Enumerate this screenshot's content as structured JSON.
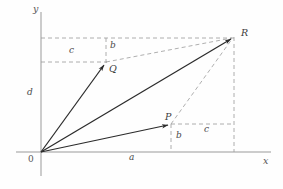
{
  "figure": {
    "kind": "vector-addition-diagram",
    "background_color": "#fefefe",
    "axis_color": "#9a9a9a",
    "vector_color": "#2b2b2b",
    "dashed_color": "#9a9a9a",
    "label_color": "#4a4a4a",
    "width": 283,
    "height": 189
  },
  "axes": {
    "origin": {
      "label": "0",
      "x": 41,
      "y": 152
    },
    "x_axis": {
      "label": "x",
      "from_x": 16,
      "to_x": 271,
      "y": 152,
      "label_x": 263,
      "label_y": 158
    },
    "y_axis": {
      "label": "y",
      "x": 41,
      "from_y": 12,
      "to_y": 176,
      "label_x": 33,
      "label_y": 6
    }
  },
  "points": [
    {
      "name": "O",
      "label": "0",
      "x": 41,
      "y": 152,
      "label_x": 29,
      "label_y": 158
    },
    {
      "name": "Q",
      "label": "Q",
      "x": 106,
      "y": 62,
      "label_x": 109,
      "label_y": 65
    },
    {
      "name": "P",
      "label": "P",
      "x": 171,
      "y": 124,
      "label_x": 165,
      "label_y": 114
    },
    {
      "name": "R",
      "label": "R",
      "x": 234,
      "y": 37,
      "label_x": 241,
      "label_y": 30
    }
  ],
  "vectors": [
    {
      "name": "OQ",
      "from": "O",
      "to": "Q",
      "x1": 41,
      "y1": 152,
      "x2": 106,
      "y2": 62,
      "style": "solid-arrow"
    },
    {
      "name": "OR",
      "from": "O",
      "to": "R",
      "x1": 41,
      "y1": 152,
      "x2": 234,
      "y2": 37,
      "style": "solid-arrow"
    },
    {
      "name": "OP",
      "from": "O",
      "to": "P",
      "x1": 41,
      "y1": 152,
      "x2": 171,
      "y2": 124,
      "style": "solid-arrow"
    }
  ],
  "construction_lines": [
    {
      "name": "QR-dashed",
      "x1": 106,
      "y1": 62,
      "x2": 234,
      "y2": 37
    },
    {
      "name": "PR-dashed",
      "x1": 171,
      "y1": 124,
      "x2": 234,
      "y2": 37
    },
    {
      "name": "top-horizontal-dashed",
      "x1": 41,
      "y1": 38,
      "x2": 234,
      "y2": 38
    },
    {
      "name": "q-horizontal-dashed",
      "x1": 41,
      "y1": 62,
      "x2": 106,
      "y2": 62
    },
    {
      "name": "p-horizontal-dashed",
      "x1": 171,
      "y1": 124,
      "x2": 234,
      "y2": 124
    },
    {
      "name": "q-vertical-dashed",
      "x1": 106,
      "y1": 38,
      "x2": 106,
      "y2": 62
    },
    {
      "name": "p-vertical-dashed",
      "x1": 171,
      "y1": 124,
      "x2": 171,
      "y2": 152
    },
    {
      "name": "r-vertical-dashed",
      "x1": 234,
      "y1": 37,
      "x2": 234,
      "y2": 152
    }
  ],
  "measure_labels": [
    {
      "name": "b-upper",
      "text": "b",
      "x": 110,
      "y": 44
    },
    {
      "name": "c-upper",
      "text": "c",
      "x": 69,
      "y": 48
    },
    {
      "name": "d-left",
      "text": "d",
      "x": 27,
      "y": 91
    },
    {
      "name": "a-bottom",
      "text": "a",
      "x": 129,
      "y": 155
    },
    {
      "name": "b-lower",
      "text": "b",
      "x": 176,
      "y": 134
    },
    {
      "name": "c-lower",
      "text": "c",
      "x": 204,
      "y": 127
    }
  ]
}
